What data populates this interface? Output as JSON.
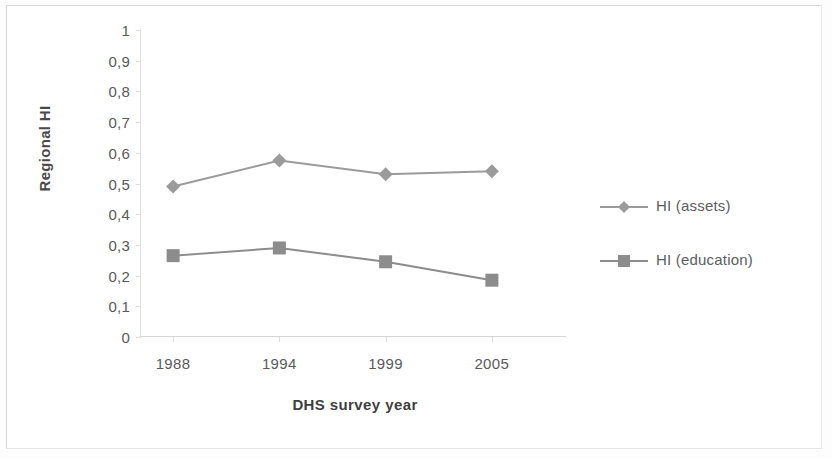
{
  "chart_data": {
    "type": "line",
    "title": "",
    "xlabel": "DHS survey year",
    "ylabel": "Regional HI",
    "categories": [
      "1988",
      "1994",
      "1999",
      "2005"
    ],
    "ylim": [
      0,
      1
    ],
    "ytick_labels": [
      "0",
      "0,1",
      "0,2",
      "0,3",
      "0,4",
      "0,5",
      "0,6",
      "0,7",
      "0,8",
      "0,9",
      "1"
    ],
    "ytick_values": [
      0,
      0.1,
      0.2,
      0.3,
      0.4,
      0.5,
      0.6,
      0.7,
      0.8,
      0.9,
      1
    ],
    "grid": false,
    "legend_position": "right",
    "series": [
      {
        "name": "HI (assets)",
        "marker": "diamond",
        "color": "#9b9b9b",
        "values": [
          0.49,
          0.575,
          0.53,
          0.54
        ]
      },
      {
        "name": "HI (education)",
        "marker": "square",
        "color": "#8c8c8c",
        "values": [
          0.265,
          0.29,
          0.245,
          0.185
        ]
      }
    ]
  },
  "legend": {
    "items": [
      {
        "label": "HI (assets)"
      },
      {
        "label": "HI (education)"
      }
    ]
  },
  "colors": {
    "assets": "#9b9b9b",
    "education": "#8c8c8c",
    "axis": "#d9d9d9",
    "text": "#59595b"
  }
}
